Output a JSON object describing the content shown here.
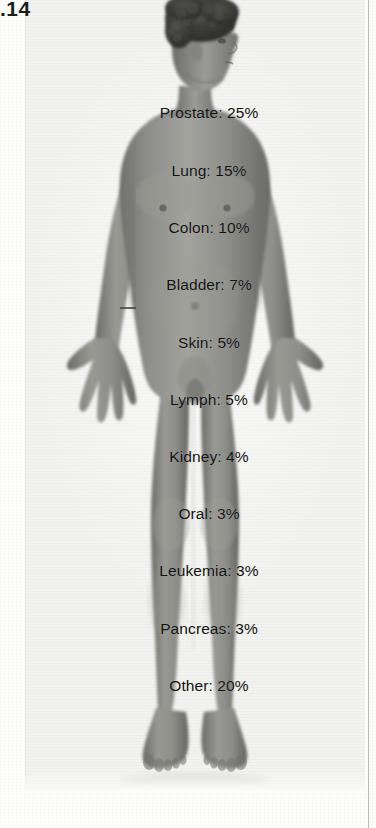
{
  "page": {
    "page_number": ".14",
    "background_color": "#fdfdfc",
    "plate_color": "#f2f2f0",
    "rule_color": "#b9b9b7"
  },
  "figure": {
    "name": "male-anatomical-figure",
    "skin_tone_hex": "#8a8a86",
    "hair_color_hex": "#3a3a38",
    "shadow_hex": "#5e5e5b",
    "highlight_hex": "#b8b8b4"
  },
  "chart_data": {
    "type": "bar",
    "title": "",
    "xlabel": "",
    "ylabel": "",
    "categories": [
      "Prostate",
      "Lung",
      "Colon",
      "Bladder",
      "Skin",
      "Lymph",
      "Kidney",
      "Oral",
      "Leukemia",
      "Pancreas",
      "Other"
    ],
    "values": [
      25,
      15,
      10,
      7,
      5,
      5,
      4,
      3,
      3,
      3,
      20
    ],
    "unit": "%",
    "ylim": [
      0,
      25
    ],
    "grid": false,
    "legend": false
  },
  "labels": [
    {
      "id": "prostate",
      "text": "Prostate: 25%",
      "site": "Prostate",
      "value": 25,
      "x": 209,
      "y": 104
    },
    {
      "id": "lung",
      "text": "Lung: 15%",
      "site": "Lung",
      "value": 15,
      "x": 209,
      "y": 162
    },
    {
      "id": "colon",
      "text": "Colon: 10%",
      "site": "Colon",
      "value": 10,
      "x": 209,
      "y": 219
    },
    {
      "id": "bladder",
      "text": "Bladder: 7%",
      "site": "Bladder",
      "value": 7,
      "x": 209,
      "y": 276
    },
    {
      "id": "skin",
      "text": "Skin: 5%",
      "site": "Skin",
      "value": 5,
      "x": 209,
      "y": 334
    },
    {
      "id": "lymph",
      "text": "Lymph: 5%",
      "site": "Lymph",
      "value": 5,
      "x": 209,
      "y": 391
    },
    {
      "id": "kidney",
      "text": "Kidney: 4%",
      "site": "Kidney",
      "value": 4,
      "x": 209,
      "y": 448
    },
    {
      "id": "oral",
      "text": "Oral: 3%",
      "site": "Oral",
      "value": 3,
      "x": 209,
      "y": 505
    },
    {
      "id": "leukemia",
      "text": "Leukemia: 3%",
      "site": "Leukemia",
      "value": 3,
      "x": 209,
      "y": 562
    },
    {
      "id": "pancreas",
      "text": "Pancreas: 3%",
      "site": "Pancreas",
      "value": 3,
      "x": 209,
      "y": 620
    },
    {
      "id": "other",
      "text": "Other: 20%",
      "site": "Other",
      "value": 20,
      "x": 209,
      "y": 677
    }
  ]
}
